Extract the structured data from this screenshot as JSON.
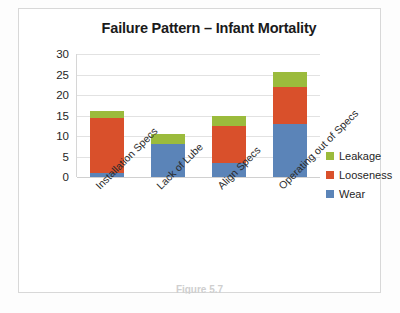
{
  "figure": {
    "caption": "Figure 5.7"
  },
  "legend": {
    "position": "right",
    "items": [
      {
        "label": "Leakage",
        "color": "#9bbb3c"
      },
      {
        "label": "Looseness",
        "color": "#d9502b"
      },
      {
        "label": "Wear",
        "color": "#5b84b8"
      }
    ]
  },
  "chart_data": {
    "type": "bar",
    "stacked": true,
    "title": "Failure Pattern – Infant Mortality",
    "xlabel": "",
    "ylabel": "",
    "ylim": [
      0,
      30
    ],
    "yticks": [
      0,
      5,
      10,
      15,
      20,
      25,
      30
    ],
    "grid": true,
    "categories": [
      "Installation Specs",
      "Lack of Lube",
      "Align Specs",
      "Operating out of Specs"
    ],
    "series": [
      {
        "name": "Wear",
        "color": "#5b84b8",
        "values": [
          1,
          8,
          3.5,
          13
        ]
      },
      {
        "name": "Looseness",
        "color": "#d9502b",
        "values": [
          13.5,
          0,
          9,
          9
        ]
      },
      {
        "name": "Leakage",
        "color": "#9bbb3c",
        "values": [
          1.5,
          2.5,
          2.5,
          3.5
        ]
      }
    ],
    "totals": [
      16,
      10.5,
      15,
      25.5
    ]
  }
}
